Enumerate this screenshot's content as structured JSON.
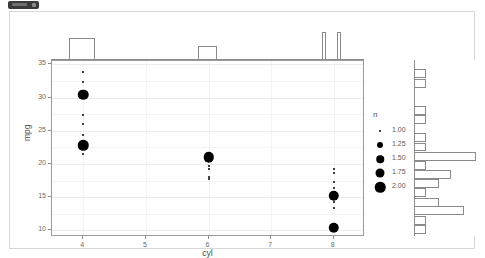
{
  "window": {
    "chip_label": ""
  },
  "chart_data": {
    "type": "scatter",
    "title": "",
    "subtitle": "",
    "xlabel": "cyl",
    "ylabel": "mpg",
    "xlim": [
      3.5,
      8.5
    ],
    "ylim": [
      9.0,
      35.5
    ],
    "x_ticks": [
      "4",
      "5",
      "6",
      "7",
      "8"
    ],
    "x_tick_values": [
      4,
      5,
      6,
      7,
      8
    ],
    "y_ticks": [
      "10",
      "15",
      "20",
      "25",
      "30",
      "35"
    ],
    "y_tick_values": [
      10,
      15,
      20,
      25,
      30,
      35
    ],
    "grid": true,
    "legend": {
      "title": "n",
      "position": "right",
      "entries": [
        {
          "label": "1.00",
          "value": 1.0,
          "size": 2.0
        },
        {
          "label": "1.25",
          "value": 1.25,
          "size": 6.0
        },
        {
          "label": "1.50",
          "value": 1.5,
          "size": 7.5
        },
        {
          "label": "1.75",
          "value": 1.75,
          "size": 9.0
        },
        {
          "label": "2.00",
          "value": 2.0,
          "size": 10.5
        }
      ]
    },
    "points": [
      {
        "x": 4,
        "y": 33.9,
        "n": 1.0
      },
      {
        "x": 4,
        "y": 32.4,
        "n": 1.0
      },
      {
        "x": 4,
        "y": 30.4,
        "n": 2.0
      },
      {
        "x": 4,
        "y": 27.3,
        "n": 1.0
      },
      {
        "x": 4,
        "y": 26.0,
        "n": 1.0
      },
      {
        "x": 4,
        "y": 24.4,
        "n": 1.0
      },
      {
        "x": 4,
        "y": 22.8,
        "n": 2.0
      },
      {
        "x": 4,
        "y": 21.5,
        "n": 1.0
      },
      {
        "x": 6,
        "y": 21.4,
        "n": 1.0
      },
      {
        "x": 6,
        "y": 21.0,
        "n": 2.0
      },
      {
        "x": 6,
        "y": 19.7,
        "n": 1.0
      },
      {
        "x": 6,
        "y": 19.2,
        "n": 1.0
      },
      {
        "x": 6,
        "y": 18.1,
        "n": 1.0
      },
      {
        "x": 6,
        "y": 17.8,
        "n": 1.0
      },
      {
        "x": 8,
        "y": 19.2,
        "n": 1.0
      },
      {
        "x": 8,
        "y": 18.7,
        "n": 1.0
      },
      {
        "x": 8,
        "y": 17.3,
        "n": 1.0
      },
      {
        "x": 8,
        "y": 16.4,
        "n": 1.0
      },
      {
        "x": 8,
        "y": 15.2,
        "n": 2.0
      },
      {
        "x": 8,
        "y": 14.3,
        "n": 1.0
      },
      {
        "x": 8,
        "y": 13.3,
        "n": 1.0
      },
      {
        "x": 8,
        "y": 10.4,
        "n": 2.0
      }
    ],
    "marginal_top": {
      "type": "histogram",
      "axis": "x",
      "bins": [
        {
          "center": 4.0,
          "width": 0.42,
          "count": 11
        },
        {
          "center": 6.0,
          "width": 0.3,
          "count": 7
        },
        {
          "center": 7.86,
          "width": 0.06,
          "count": 14
        },
        {
          "center": 8.1,
          "width": 0.06,
          "count": 14
        }
      ],
      "ylim": [
        0,
        15
      ]
    },
    "marginal_right": {
      "type": "histogram",
      "axis": "y",
      "bins": [
        {
          "center": 33.4,
          "width": 1.35,
          "count": 1
        },
        {
          "center": 32.0,
          "width": 1.35,
          "count": 1
        },
        {
          "center": 30.7,
          "width": 1.35,
          "count": 0
        },
        {
          "center": 27.9,
          "width": 1.35,
          "count": 1
        },
        {
          "center": 26.5,
          "width": 1.35,
          "count": 1
        },
        {
          "center": 25.1,
          "width": 1.35,
          "count": 0
        },
        {
          "center": 23.8,
          "width": 1.35,
          "count": 1
        },
        {
          "center": 22.4,
          "width": 1.35,
          "count": 1
        },
        {
          "center": 21.0,
          "width": 1.35,
          "count": 5
        },
        {
          "center": 19.6,
          "width": 1.35,
          "count": 1
        },
        {
          "center": 18.3,
          "width": 1.35,
          "count": 3
        },
        {
          "center": 16.9,
          "width": 1.35,
          "count": 2
        },
        {
          "center": 15.5,
          "width": 1.35,
          "count": 1
        },
        {
          "center": 14.1,
          "width": 1.35,
          "count": 2
        },
        {
          "center": 12.8,
          "width": 1.35,
          "count": 4
        },
        {
          "center": 11.4,
          "width": 1.35,
          "count": 1
        },
        {
          "center": 10.0,
          "width": 1.35,
          "count": 1
        }
      ],
      "xlim": [
        0,
        5
      ]
    }
  }
}
